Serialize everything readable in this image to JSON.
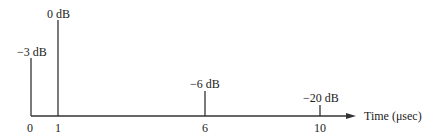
{
  "diagram": {
    "axis_label": "Time (μsec)",
    "impulses": [
      {
        "time": "0",
        "level": "−3 dB"
      },
      {
        "time": "1",
        "level": "0 dB"
      },
      {
        "time": "6",
        "level": "−6 dB"
      },
      {
        "time": "10",
        "level": "−20 dB"
      }
    ]
  }
}
